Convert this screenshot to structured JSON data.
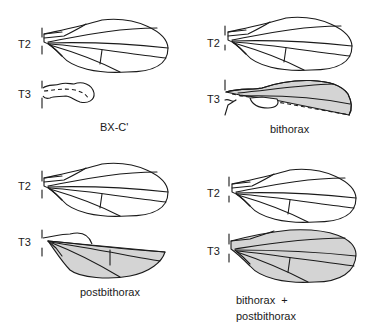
{
  "figure": {
    "colors": {
      "line": "#1a1a1a",
      "normal_fill": "#ffffff",
      "transformed_fill": "#d4d4d4",
      "background": "#ffffff"
    },
    "panels": [
      {
        "id": "bx-c",
        "segment_labels": {
          "t2": "T2",
          "t3": "T3"
        },
        "caption": [
          "BX-C'"
        ],
        "t3_state": "haltere"
      },
      {
        "id": "bithorax",
        "segment_labels": {
          "t2": "T2",
          "t3": "T3"
        },
        "caption": [
          "bithorax"
        ],
        "t3_state": "anterior compartment transformed to wing"
      },
      {
        "id": "postbithorax",
        "segment_labels": {
          "t2": "T2",
          "t3": "T3"
        },
        "caption": [
          "postbithorax"
        ],
        "t3_state": "posterior compartment transformed to wing"
      },
      {
        "id": "bithorax-postbithorax",
        "segment_labels": {
          "t2": "T2",
          "t3": "T3"
        },
        "caption": [
          "bithorax  +",
          "postbithorax"
        ],
        "t3_state": "complete wing"
      }
    ]
  }
}
